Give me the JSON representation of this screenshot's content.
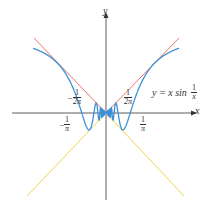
{
  "figure": {
    "axes": {
      "x_label": "x",
      "y_label": "y"
    },
    "equation_label": {
      "lhs": "y = x sin",
      "frac_num": "1",
      "frac_den": "x"
    },
    "tick_labels": [
      {
        "id": "neg-1-over-2pi",
        "sign": "−",
        "num": "1",
        "den": "2π"
      },
      {
        "id": "pos-1-over-2pi",
        "sign": "",
        "num": "1",
        "den": "2π"
      },
      {
        "id": "neg-1-over-pi",
        "sign": "−",
        "num": "1",
        "den": "π"
      },
      {
        "id": "pos-1-over-pi",
        "sign": "",
        "num": "1",
        "den": "π"
      }
    ],
    "curves": [
      {
        "name": "y = x sin(1/x)",
        "color": "#3a8fd6"
      },
      {
        "name": "y = x",
        "color": "#e8776a"
      },
      {
        "name": "y = -x",
        "color": "#f2d24a"
      }
    ],
    "axis_color": "#333333"
  }
}
